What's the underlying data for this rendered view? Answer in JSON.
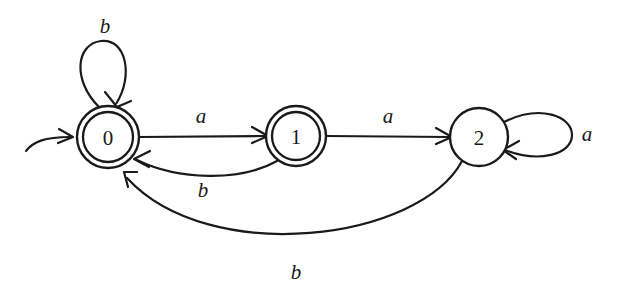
{
  "diagram": {
    "type": "finite-state-automaton",
    "background_color": "#ffffff",
    "stroke_color": "#1a1a1a",
    "alphabet": [
      "a",
      "b"
    ],
    "start_state": "0",
    "accepting_states": [
      "0",
      "1"
    ]
  },
  "states": [
    {
      "id": "state0",
      "label": "0",
      "cx": 108,
      "cy": 137,
      "r_outer": 31,
      "r_inner": 25,
      "accepting": true,
      "is_start": true
    },
    {
      "id": "state1",
      "label": "1",
      "cx": 296,
      "cy": 136,
      "r_outer": 30,
      "r_inner": 24,
      "accepting": true,
      "is_start": false
    },
    {
      "id": "state2",
      "label": "2",
      "cx": 479,
      "cy": 137,
      "r_outer": 29,
      "r_inner": 0,
      "accepting": false,
      "is_start": false
    }
  ],
  "transitions": [
    {
      "id": "t-0-0-b",
      "from": "0",
      "to": "0",
      "symbol": "b",
      "kind": "self-loop",
      "label_x": 105,
      "label_y": 26
    },
    {
      "id": "t-0-1-a",
      "from": "0",
      "to": "1",
      "symbol": "a",
      "kind": "straight",
      "label_x": 201,
      "label_y": 116
    },
    {
      "id": "t-1-2-a",
      "from": "1",
      "to": "2",
      "symbol": "a",
      "kind": "straight",
      "label_x": 388,
      "label_y": 116
    },
    {
      "id": "t-1-0-b",
      "from": "1",
      "to": "0",
      "symbol": "b",
      "kind": "curve",
      "label_x": 203,
      "label_y": 190
    },
    {
      "id": "t-2-0-b",
      "from": "2",
      "to": "0",
      "symbol": "b",
      "kind": "curve",
      "label_x": 296,
      "label_y": 272
    },
    {
      "id": "t-2-2-a",
      "from": "2",
      "to": "2",
      "symbol": "a",
      "kind": "self-loop",
      "label_x": 587,
      "label_y": 134
    }
  ],
  "start_marker": {
    "id": "start-arrow",
    "description": "incoming start arrow into state 0"
  }
}
